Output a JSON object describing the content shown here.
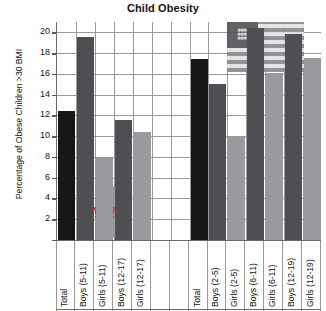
{
  "chart": {
    "title": "Child Obesity",
    "ylabel": "Percentage of Obese Children >30 BMI",
    "xlabel": ""
  },
  "axis": {
    "ticks": [
      "20",
      "18",
      "16",
      "14",
      "12",
      "10",
      "8",
      "6",
      "4",
      "2"
    ]
  },
  "watermarks": {
    "canada": "canada-flag-watermark",
    "usa": "usa-flag-watermark"
  },
  "chart_data": {
    "type": "bar",
    "title": "Child Obesity",
    "xlabel": "",
    "ylabel": "Percentage of Obese Children >30 BMI",
    "ylim": [
      0,
      21
    ],
    "yticks": [
      2,
      4,
      6,
      8,
      10,
      12,
      14,
      16,
      18,
      20
    ],
    "grid": true,
    "legend": "none",
    "categories": [
      "Total",
      "Boys (5-11)",
      "Girls (5-11)",
      "Boys (12-17)",
      "Girls (12-17)",
      "",
      "",
      "Total",
      "Boys (2-5)",
      "Girls (2-5)",
      "Boys (6-11)",
      "Girls (6-11)",
      "Boys (12-19)",
      "Girls (12-19)"
    ],
    "values": [
      12.4,
      19.6,
      7.9,
      11.6,
      10.4,
      null,
      null,
      17.4,
      15.0,
      9.9,
      20.4,
      16.1,
      19.8,
      17.5
    ],
    "series_groups": [
      {
        "name": "Canada",
        "categories": [
          "Total",
          "Boys (5-11)",
          "Girls (5-11)",
          "Boys (12-17)",
          "Girls (12-17)"
        ],
        "values": [
          12.4,
          19.6,
          7.9,
          11.6,
          10.4
        ]
      },
      {
        "name": "United States",
        "categories": [
          "Total",
          "Boys (2-5)",
          "Girls (2-5)",
          "Boys (6-11)",
          "Girls (6-11)",
          "Boys (12-19)",
          "Girls (12-19)"
        ],
        "values": [
          17.4,
          15.0,
          9.9,
          20.4,
          16.1,
          19.8,
          17.5
        ]
      }
    ],
    "colors": {
      "total": "#17171a",
      "boys": "#4f4f53",
      "girls": "#9a9a9e",
      "gridline": "#9a9a9a",
      "axis": "#6b6b6b"
    }
  }
}
